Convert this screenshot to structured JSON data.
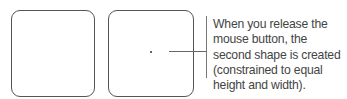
{
  "shapes": [
    {
      "name": "first-shape"
    },
    {
      "name": "second-shape"
    }
  ],
  "callout": {
    "text": "When you release the mouse button, the second shape is created (constrained to equal height and width)."
  }
}
